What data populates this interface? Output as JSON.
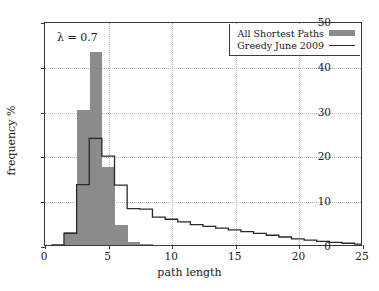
{
  "chart_data": {
    "type": "bar",
    "title": "",
    "xlabel": "path length",
    "ylabel": "frequency %",
    "xlim": [
      0,
      25
    ],
    "ylim": [
      0,
      50
    ],
    "xticks": [
      0,
      5,
      10,
      15,
      20,
      25
    ],
    "yticks": [
      0,
      10,
      20,
      30,
      40,
      50
    ],
    "grid": true,
    "annotation": "λ = 0.7",
    "legend_position": "top-right",
    "categories": [
      1,
      2,
      3,
      4,
      5,
      6,
      7,
      8,
      9,
      10,
      11,
      12,
      13,
      14,
      15,
      16,
      17,
      18,
      19,
      20,
      21,
      22,
      23,
      24,
      25
    ],
    "series": [
      {
        "name": "All Shortest Paths",
        "style": "bar",
        "color": "#8b8b8b",
        "values": [
          0,
          3.0,
          30.2,
          43.0,
          17.5,
          4.5,
          0.7,
          0.2,
          0,
          0,
          0,
          0,
          0,
          0,
          0,
          0,
          0,
          0,
          0,
          0,
          0,
          0,
          0,
          0,
          0
        ]
      },
      {
        "name": "Greedy June 2009",
        "style": "line",
        "color": "#2a2a2a",
        "values": [
          0,
          2.6,
          13.6,
          24.0,
          20.0,
          13.5,
          8.2,
          8.1,
          6.3,
          5.8,
          5.2,
          4.6,
          4.2,
          3.8,
          3.4,
          3.0,
          2.6,
          2.2,
          1.8,
          1.4,
          1.1,
          0.8,
          0.6,
          0.4,
          0.2
        ]
      }
    ]
  },
  "legend": {
    "items": [
      {
        "label": "All Shortest Paths",
        "swatch": "bar"
      },
      {
        "label": "Greedy June 2009",
        "swatch": "line"
      }
    ]
  }
}
